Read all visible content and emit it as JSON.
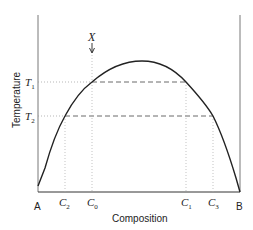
{
  "diagram": {
    "type": "phase-diagram-miscibility-gap",
    "xlabel": "Composition",
    "ylabel": "Temperature",
    "endpoints": {
      "left": "A",
      "right": "B"
    },
    "marker": {
      "label": "X"
    },
    "temperatures": [
      {
        "label": "T",
        "sub": "1"
      },
      {
        "label": "T",
        "sub": "2"
      }
    ],
    "compositions": [
      {
        "label": "C",
        "sub": "2"
      },
      {
        "label": "C",
        "sub": "0"
      },
      {
        "label": "C",
        "sub": "1"
      },
      {
        "label": "C",
        "sub": "3"
      }
    ],
    "colors": {
      "line": "#222222",
      "guide": "#888888"
    }
  }
}
